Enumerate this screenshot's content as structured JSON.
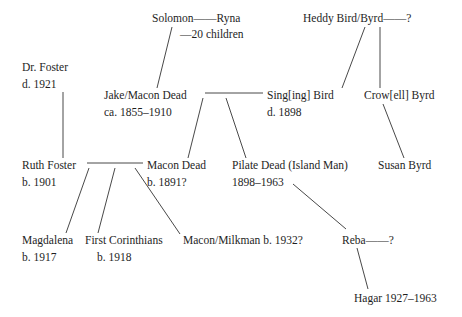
{
  "diagram": {
    "type": "family-tree",
    "nodes": {
      "solomon_ryna": {
        "line1": "Solomon——Ryna",
        "line2": "—20 children"
      },
      "heddy": {
        "line1": "Heddy Bird/Byrd——?"
      },
      "dr_foster": {
        "line1": "Dr. Foster",
        "line2": "d. 1921"
      },
      "jake": {
        "line1": "Jake/Macon Dead",
        "line2": "ca. 1855–1910"
      },
      "singing_bird": {
        "line1": "Sing[ing] Bird",
        "line2": "d. 1898"
      },
      "crowell": {
        "line1": "Crow[ell] Byrd"
      },
      "ruth": {
        "line1": "Ruth Foster",
        "line2": "b. 1901"
      },
      "macon_dead": {
        "line1": "Macon Dead",
        "line2": "b. 1891?"
      },
      "pilate": {
        "line1": "Pilate Dead (Island Man)",
        "line2": "1898–1963"
      },
      "susan": {
        "line1": "Susan Byrd"
      },
      "magdalena": {
        "line1": "Magdalena",
        "line2": "b. 1917"
      },
      "first_corinthians": {
        "line1": "First Corinthians",
        "line2": "b. 1918"
      },
      "milkman": {
        "line1": "Macon/Milkman b. 1932?"
      },
      "reba": {
        "line1": "Reba——?"
      },
      "hagar": {
        "line1": "Hagar 1927–1963"
      }
    },
    "edges": [
      {
        "from": "Solomon",
        "to": "Jake/Macon Dead",
        "kind": "parent-child"
      },
      {
        "from": "Heddy Bird/Byrd",
        "to": "Sing[ing] Bird",
        "kind": "parent-child"
      },
      {
        "from": "Heddy Bird/Byrd",
        "to": "Crow[ell] Byrd",
        "kind": "parent-child"
      },
      {
        "from": "Jake/Macon Dead",
        "to": "Sing[ing] Bird",
        "kind": "marriage"
      },
      {
        "from": "Jake/Macon Dead + Sing[ing] Bird",
        "to": "Macon Dead",
        "kind": "parent-child"
      },
      {
        "from": "Jake/Macon Dead + Sing[ing] Bird",
        "to": "Pilate Dead (Island Man)",
        "kind": "parent-child"
      },
      {
        "from": "Crow[ell] Byrd",
        "to": "Susan Byrd",
        "kind": "parent-child"
      },
      {
        "from": "Dr. Foster",
        "to": "Ruth Foster",
        "kind": "parent-child"
      },
      {
        "from": "Ruth Foster",
        "to": "Macon Dead",
        "kind": "marriage"
      },
      {
        "from": "Ruth Foster + Macon Dead",
        "to": "Magdalena",
        "kind": "parent-child"
      },
      {
        "from": "Ruth Foster + Macon Dead",
        "to": "First Corinthians",
        "kind": "parent-child"
      },
      {
        "from": "Ruth Foster + Macon Dead",
        "to": "Macon/Milkman",
        "kind": "parent-child"
      },
      {
        "from": "Pilate Dead",
        "to": "Reba",
        "kind": "parent-child"
      },
      {
        "from": "Reba",
        "to": "Hagar",
        "kind": "parent-child"
      }
    ]
  }
}
